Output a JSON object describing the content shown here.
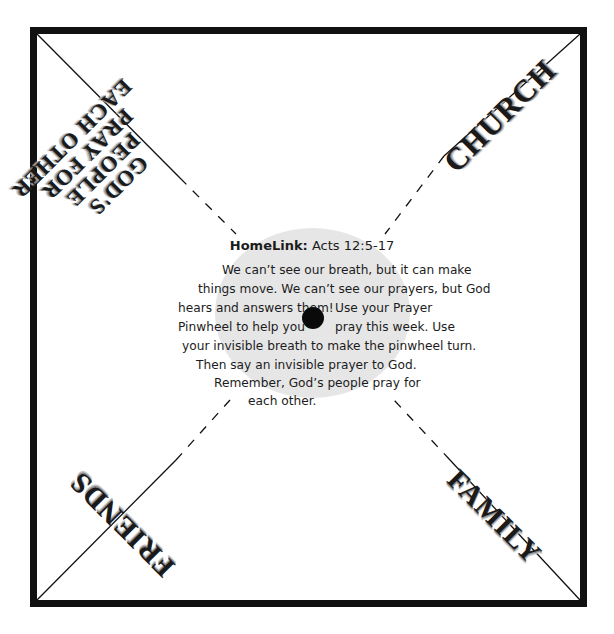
{
  "document": {
    "type": "Prayer Pinwheel craft template",
    "corners": {
      "top_left": [
        "GOD'S",
        "PEOPLE",
        "PRAY FOR",
        "EACH OTHER"
      ],
      "top_right": "CHURCH",
      "bottom_right": "FAMILY",
      "bottom_left": "FRIENDS"
    },
    "center": {
      "title_bold": "HomeLink:",
      "title_ref": "Acts 12:5-17",
      "lines": [
        "We can’t see our breath, but it can make",
        "things move. We can’t see our prayers, but God",
        "hears and answers them!",
        "Use your Prayer",
        "Pinwheel to help you",
        "pray this week. Use",
        "your invisible breath to make the pinwheel turn.",
        "Then say an invisible prayer to God.",
        "Remember, God’s people pray for",
        "each other."
      ]
    },
    "colors": {
      "border": "#111111",
      "ellipse": "#e6e6e6",
      "hole": "#0a0a0a"
    }
  }
}
